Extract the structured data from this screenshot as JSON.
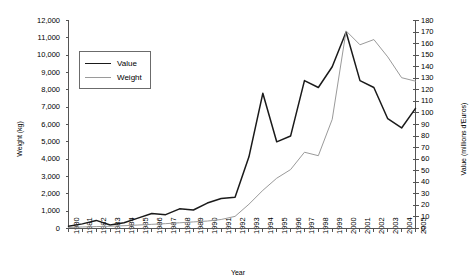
{
  "chart_data": {
    "type": "line",
    "title": "",
    "xlabel": "Year",
    "ylabel": "Weight (kg)",
    "ylabel_right": "Value (millions d'Euros)",
    "grid": false,
    "legend_position": "upper-left-inside",
    "categories": [
      "1980",
      "1981",
      "1982",
      "1983",
      "1984",
      "1985",
      "1986",
      "1987",
      "1988",
      "1989",
      "1990",
      "1991",
      "1992",
      "1993",
      "1994",
      "1995",
      "1996",
      "1997",
      "1998",
      "1999",
      "2000",
      "2001",
      "2002",
      "2003",
      "2004",
      "2005"
    ],
    "ylim": [
      0,
      12000
    ],
    "yticks": [
      "0",
      "1,000",
      "2,000",
      "3,000",
      "4,000",
      "5,000",
      "6,000",
      "7,000",
      "8,000",
      "9,000",
      "10,000",
      "11,000",
      "12,000"
    ],
    "ylim_right": [
      0,
      180
    ],
    "yticks_right": [
      "0",
      "10",
      "20",
      "30",
      "40",
      "50",
      "60",
      "70",
      "80",
      "90",
      "100",
      "110",
      "120",
      "130",
      "140",
      "150",
      "160",
      "170",
      "180"
    ],
    "series": [
      {
        "name": "Value",
        "axis": "right",
        "unit": "millions d'Euros",
        "color": "#1a1a1a",
        "values": [
          2,
          4,
          7,
          3,
          5,
          9,
          13,
          12,
          17,
          16,
          22,
          26,
          27,
          62,
          117,
          75,
          80,
          128,
          122,
          140,
          170,
          128,
          122,
          95,
          87,
          104
        ]
      },
      {
        "name": "Weight",
        "axis": "left",
        "unit": "kg",
        "color": "#9a9a9a",
        "values": [
          60,
          90,
          110,
          130,
          160,
          200,
          240,
          280,
          330,
          380,
          430,
          520,
          700,
          1400,
          2200,
          2900,
          3400,
          4400,
          4200,
          6300,
          11400,
          10600,
          10900,
          9900,
          8700,
          8500
        ]
      }
    ]
  },
  "legend": {
    "items": [
      {
        "label": "Value"
      },
      {
        "label": "Weight"
      }
    ]
  }
}
